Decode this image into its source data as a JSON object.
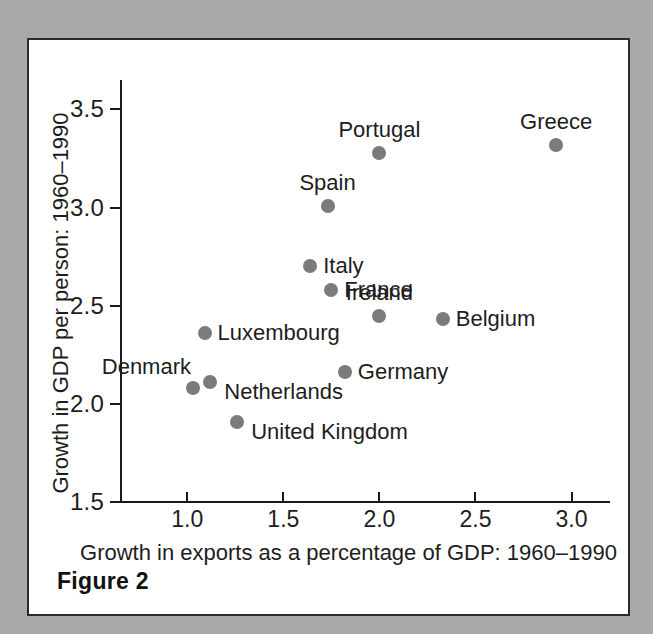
{
  "figure": {
    "caption": "Figure 2"
  },
  "chart_data": {
    "type": "scatter",
    "title": "",
    "xlabel": "Growth in exports as a percentage of GDP: 1960–1990",
    "ylabel": "Growth in GDP per person: 1960–1990",
    "xlim": [
      0.65,
      3.2
    ],
    "ylim": [
      1.5,
      3.65
    ],
    "xticks": [
      "1.0",
      "1.5",
      "2.0",
      "2.5",
      "3.0"
    ],
    "xtick_values": [
      1.0,
      1.5,
      2.0,
      2.5,
      3.0
    ],
    "yticks": [
      "1.5",
      "2.0",
      "2.5",
      "3.0",
      "3.5"
    ],
    "ytick_values": [
      1.5,
      2.0,
      2.5,
      3.0,
      3.5
    ],
    "grid": false,
    "legend": false,
    "marker_color": "#7b7b7b",
    "points": [
      {
        "label": "Greece",
        "x": 2.92,
        "y": 3.32,
        "label_pos": "above"
      },
      {
        "label": "Portugal",
        "x": 2.0,
        "y": 3.28,
        "label_pos": "above"
      },
      {
        "label": "Spain",
        "x": 1.73,
        "y": 3.01,
        "label_pos": "above"
      },
      {
        "label": "Italy",
        "x": 1.64,
        "y": 2.7,
        "label_pos": "right"
      },
      {
        "label": "France",
        "x": 1.75,
        "y": 2.58,
        "label_pos": "right"
      },
      {
        "label": "Ireland",
        "x": 2.0,
        "y": 2.45,
        "label_pos": "above"
      },
      {
        "label": "Belgium",
        "x": 2.33,
        "y": 2.43,
        "label_pos": "right"
      },
      {
        "label": "Luxembourg",
        "x": 1.09,
        "y": 2.36,
        "label_pos": "right"
      },
      {
        "label": "Netherlands",
        "x": 1.12,
        "y": 2.11,
        "label_pos": "right-low"
      },
      {
        "label": "Denmark",
        "x": 1.03,
        "y": 2.08,
        "label_pos": "above-left"
      },
      {
        "label": "Germany",
        "x": 1.82,
        "y": 2.16,
        "label_pos": "right"
      },
      {
        "label": "United Kingdom",
        "x": 1.26,
        "y": 1.91,
        "label_pos": "right-low"
      }
    ]
  }
}
